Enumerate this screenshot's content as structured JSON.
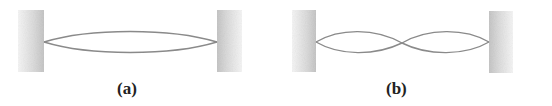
{
  "figures": [
    {
      "id": "a",
      "label": "(a)",
      "description": "String fixed between two walls vibrating in fundamental mode (one loop)",
      "loops": 1
    },
    {
      "id": "b",
      "label": "(b)",
      "description": "String fixed between two walls vibrating in second harmonic (two loops, one node at center)",
      "loops": 2
    }
  ],
  "colors": {
    "string": "#8a8a8a",
    "wall_dark": "#c8c8c8",
    "wall_light": "#f4f4f4",
    "label": "#222222",
    "background": "#ffffff"
  }
}
